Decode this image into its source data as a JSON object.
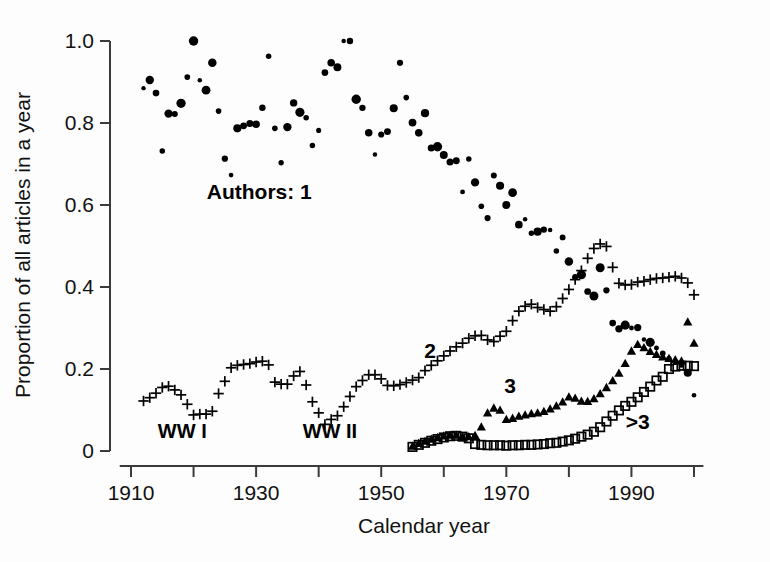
{
  "chart_data": {
    "type": "scatter",
    "title": "",
    "xlabel": "Calendar year",
    "ylabel": "Proportion of all articles in a year",
    "xlim": [
      1908,
      2001
    ],
    "ylim": [
      0,
      1.0
    ],
    "grid": false,
    "legend_position": "inline-annotations",
    "x_ticks": [
      1910,
      1920,
      1930,
      1940,
      1950,
      1960,
      1970,
      1980,
      1990,
      2000
    ],
    "x_tick_labels": [
      "1910",
      "",
      "1930",
      "",
      "1950",
      "",
      "1970",
      "",
      "1990",
      ""
    ],
    "y_ticks": [
      0,
      0.2,
      0.4,
      0.6,
      0.8,
      1.0
    ],
    "y_tick_labels": [
      "0",
      "0.2",
      "0.4",
      "0.6",
      "0.8",
      "1.0"
    ],
    "annotations": [
      {
        "text": "Authors: 1",
        "x": 1930.5,
        "y": 0.615,
        "name": "annotation-authors-1"
      },
      {
        "text": "2",
        "x": 1957.8,
        "y": 0.228,
        "name": "annotation-authors-2"
      },
      {
        "text": "3",
        "x": 1970.6,
        "y": 0.142,
        "name": "annotation-authors-3"
      },
      {
        "text": ">3",
        "x": 1991.0,
        "y": 0.053,
        "name": "annotation-authors-gt3"
      },
      {
        "text": "WW I",
        "x": 1918.2,
        "y": 0.032,
        "name": "annotation-ww1"
      },
      {
        "text": "WW II",
        "x": 1941.8,
        "y": 0.032,
        "name": "annotation-ww2"
      }
    ],
    "series": [
      {
        "name": "1",
        "label": "Authors: 1",
        "marker": "filled-circle",
        "color": "#000000",
        "x": [
          1912,
          1913,
          1914,
          1915,
          1916,
          1917,
          1918,
          1919,
          1920,
          1921,
          1922,
          1923,
          1924,
          1925,
          1926,
          1927,
          1928,
          1929,
          1930,
          1931,
          1932,
          1933,
          1934,
          1935,
          1936,
          1937,
          1938,
          1939,
          1940,
          1941,
          1942,
          1943,
          1944,
          1945,
          1946,
          1947,
          1948,
          1949,
          1950,
          1951,
          1952,
          1953,
          1954,
          1955,
          1956,
          1957,
          1958,
          1959,
          1960,
          1961,
          1962,
          1963,
          1964,
          1965,
          1966,
          1967,
          1968,
          1969,
          1970,
          1971,
          1972,
          1973,
          1974,
          1975,
          1976,
          1977,
          1978,
          1979,
          1980,
          1981,
          1982,
          1983,
          1984,
          1985,
          1986,
          1987,
          1988,
          1989,
          1990,
          1991,
          1992,
          1993,
          1994,
          1995,
          1996,
          1997,
          1998,
          1999,
          2000
        ],
        "y": [
          0.885,
          0.905,
          0.873,
          0.732,
          0.823,
          0.822,
          0.848,
          0.912,
          1.0,
          0.904,
          0.88,
          0.947,
          0.829,
          0.713,
          0.673,
          0.787,
          0.793,
          0.799,
          0.797,
          0.837,
          0.963,
          0.787,
          0.703,
          0.79,
          0.849,
          0.826,
          0.813,
          0.745,
          0.782,
          0.923,
          0.947,
          0.936,
          1.0,
          1.0,
          0.858,
          0.837,
          0.776,
          0.723,
          0.772,
          0.779,
          0.836,
          0.947,
          0.862,
          0.801,
          0.776,
          0.824,
          0.739,
          0.742,
          0.722,
          0.705,
          0.708,
          0.632,
          0.712,
          0.655,
          0.597,
          0.568,
          0.672,
          0.647,
          0.6,
          0.63,
          0.552,
          0.565,
          0.531,
          0.535,
          0.54,
          0.539,
          0.488,
          0.521,
          0.462,
          0.424,
          0.43,
          0.389,
          0.378,
          0.447,
          0.392,
          0.312,
          0.298,
          0.307,
          0.3,
          0.301,
          0.272,
          0.265,
          0.251,
          0.238,
          0.226,
          0.216,
          0.21,
          0.191,
          0.136
        ],
        "y_note": "Fraction of single-authored articles; declines from ~0.89 in 1912 to ~0.14 by 2000"
      },
      {
        "name": "2",
        "label": "2",
        "marker": "plus",
        "color": "#000000",
        "x": [
          1912,
          1913,
          1914,
          1915,
          1916,
          1917,
          1918,
          1919,
          1920,
          1921,
          1922,
          1923,
          1924,
          1925,
          1926,
          1927,
          1928,
          1929,
          1930,
          1931,
          1932,
          1933,
          1934,
          1935,
          1936,
          1937,
          1938,
          1939,
          1940,
          1941,
          1942,
          1943,
          1944,
          1945,
          1946,
          1947,
          1948,
          1949,
          1950,
          1951,
          1952,
          1953,
          1954,
          1955,
          1956,
          1957,
          1958,
          1959,
          1960,
          1961,
          1962,
          1963,
          1964,
          1965,
          1966,
          1967,
          1968,
          1969,
          1970,
          1971,
          1972,
          1973,
          1974,
          1975,
          1976,
          1977,
          1978,
          1979,
          1980,
          1981,
          1982,
          1983,
          1984,
          1985,
          1986,
          1987,
          1988,
          1989,
          1990,
          1991,
          1992,
          1993,
          1994,
          1995,
          1996,
          1997,
          1998,
          1999,
          2000
        ],
        "y": [
          0.122,
          0.13,
          0.141,
          0.155,
          0.158,
          0.149,
          0.137,
          0.114,
          0.088,
          0.09,
          0.09,
          0.097,
          0.14,
          0.17,
          0.203,
          0.209,
          0.211,
          0.213,
          0.217,
          0.219,
          0.21,
          0.168,
          0.163,
          0.163,
          0.183,
          0.194,
          0.161,
          0.12,
          0.093,
          0.065,
          0.077,
          0.086,
          0.108,
          0.133,
          0.157,
          0.172,
          0.186,
          0.186,
          0.176,
          0.16,
          0.159,
          0.162,
          0.167,
          0.173,
          0.179,
          0.196,
          0.209,
          0.22,
          0.232,
          0.244,
          0.254,
          0.263,
          0.275,
          0.281,
          0.282,
          0.271,
          0.267,
          0.28,
          0.292,
          0.318,
          0.341,
          0.353,
          0.358,
          0.35,
          0.345,
          0.341,
          0.352,
          0.372,
          0.394,
          0.418,
          0.44,
          0.47,
          0.494,
          0.505,
          0.499,
          0.448,
          0.409,
          0.405,
          0.406,
          0.412,
          0.414,
          0.418,
          0.421,
          0.422,
          0.424,
          0.426,
          0.422,
          0.41,
          0.381
        ],
        "y_note": "Fraction of two-authored articles; rises from ~0.12 to a peak ~0.50 around 1986, then ~0.38-0.42"
      },
      {
        "name": "3",
        "label": "3",
        "marker": "filled-triangle",
        "color": "#000000",
        "x": [
          1955,
          1956,
          1957,
          1958,
          1959,
          1960,
          1961,
          1962,
          1963,
          1964,
          1965,
          1966,
          1967,
          1968,
          1969,
          1970,
          1971,
          1972,
          1973,
          1974,
          1975,
          1976,
          1977,
          1978,
          1979,
          1980,
          1981,
          1982,
          1983,
          1984,
          1985,
          1986,
          1987,
          1988,
          1989,
          1990,
          1991,
          1992,
          1993,
          1994,
          1995,
          1996,
          1997,
          1998,
          1999,
          2000
        ],
        "y": [
          0.012,
          0.019,
          0.024,
          0.029,
          0.033,
          0.037,
          0.039,
          0.039,
          0.036,
          0.035,
          0.038,
          0.059,
          0.093,
          0.105,
          0.1,
          0.077,
          0.08,
          0.085,
          0.088,
          0.091,
          0.093,
          0.097,
          0.103,
          0.11,
          0.12,
          0.132,
          0.129,
          0.122,
          0.121,
          0.128,
          0.14,
          0.155,
          0.172,
          0.19,
          0.214,
          0.244,
          0.26,
          0.252,
          0.243,
          0.236,
          0.23,
          0.226,
          0.223,
          0.22,
          0.315,
          0.263
        ],
        "y_note": "Fraction of three-authored articles; begins ~1955 near 0.01, reaches ~0.26 by mid-1990s"
      },
      {
        "name": ">3",
        "label": ">3",
        "marker": "open-square",
        "color": "#000000",
        "x": [
          1955,
          1956,
          1957,
          1958,
          1959,
          1960,
          1961,
          1962,
          1963,
          1964,
          1965,
          1966,
          1967,
          1968,
          1969,
          1970,
          1971,
          1972,
          1973,
          1974,
          1975,
          1976,
          1977,
          1978,
          1979,
          1980,
          1981,
          1982,
          1983,
          1984,
          1985,
          1986,
          1987,
          1988,
          1989,
          1990,
          1991,
          1992,
          1993,
          1994,
          1995,
          1996,
          1997,
          1998,
          1999,
          2000
        ],
        "y": [
          0.01,
          0.015,
          0.02,
          0.025,
          0.029,
          0.033,
          0.036,
          0.037,
          0.035,
          0.031,
          0.017,
          0.015,
          0.014,
          0.014,
          0.014,
          0.013,
          0.014,
          0.014,
          0.015,
          0.015,
          0.016,
          0.017,
          0.019,
          0.02,
          0.023,
          0.026,
          0.03,
          0.035,
          0.04,
          0.047,
          0.058,
          0.072,
          0.086,
          0.099,
          0.11,
          0.12,
          0.131,
          0.144,
          0.157,
          0.172,
          0.181,
          0.2,
          0.206,
          0.208,
          0.208,
          0.207
        ],
        "y_note": "Fraction of articles with more than three authors; begins ~1955 near 0.01, climbs to ~0.21 by 2000"
      }
    ]
  },
  "figure": {
    "ylabel": "Proportion of all articles in a year",
    "xlabel": "Calendar year"
  }
}
